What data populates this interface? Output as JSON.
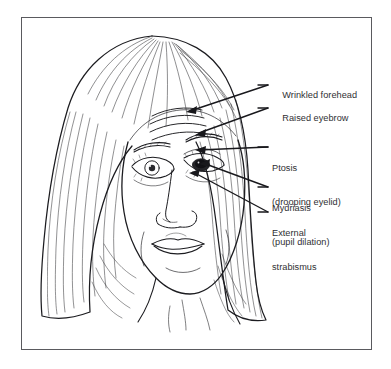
{
  "figure": {
    "affected_side": "patient-left-eye-as-drawn-on-image-right",
    "background_color": "#ffffff",
    "frame_color": "#5a5a5e",
    "ink_color": "#1c1c20",
    "text_color": "#2f2f33"
  },
  "labels": [
    {
      "id": "wrinkled-forehead",
      "line1": "Wrinkled forehead",
      "line2": "",
      "x": 272,
      "y": 79,
      "leader_from": [
        268,
        85
      ],
      "leader_to": [
        186,
        112
      ]
    },
    {
      "id": "raised-eyebrow",
      "line1": "Raised eyebrow",
      "line2": "",
      "x": 272,
      "y": 102,
      "leader_from": [
        268,
        108
      ],
      "leader_to": [
        196,
        134
      ]
    },
    {
      "id": "ptosis",
      "line1": "Ptosis",
      "line2": "(drooping eyelid)",
      "x": 272,
      "y": 141,
      "leader_from": [
        268,
        147
      ],
      "leader_to": [
        196,
        150
      ]
    },
    {
      "id": "mydriasis",
      "line1": "Mydriasis",
      "line2": "(pupil dilation)",
      "x": 272,
      "y": 181,
      "leader_from": [
        268,
        187
      ],
      "leader_to": [
        200,
        163
      ]
    },
    {
      "id": "external-strabismus",
      "line1": "External",
      "line2": "strabismus",
      "x": 272,
      "y": 206,
      "leader_from": [
        268,
        212
      ],
      "leader_to": [
        190,
        173
      ]
    }
  ],
  "face_features": {
    "normal_eye": "open-eye-with-round-iris-and-lashes",
    "affected_eye": "drooping-lid-over-dark-dilated-pupil",
    "forehead": "horizontal-wrinkle-creases",
    "hair": "long-straight-hair-parted-on-right",
    "nose": "small-nose-with-nostrils",
    "mouth": "closed-lips",
    "neck": "visible-with-collar-lines"
  }
}
